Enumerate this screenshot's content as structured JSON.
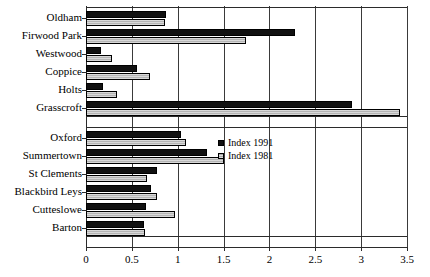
{
  "chart_data": {
    "type": "bar",
    "orientation": "horizontal",
    "title": "",
    "xlabel": "",
    "ylabel": "",
    "xlim": [
      0,
      3.5
    ],
    "xticks": [
      0,
      0.5,
      1,
      1.5,
      2,
      2.5,
      3,
      3.5
    ],
    "xtick_labels": [
      "0",
      "0.5",
      "1",
      "1.5",
      "2",
      "2.5",
      "3",
      "3.5"
    ],
    "grid": true,
    "grid_axis": "x",
    "legend_position": "center-right",
    "legend": [
      "Index 1991",
      "Index 1981"
    ],
    "series": [
      {
        "name": "Index 1991",
        "color": "#111111",
        "values": [
          0.87,
          2.28,
          0.16,
          0.56,
          0.18,
          2.9,
          1.04,
          1.32,
          0.77,
          0.71,
          0.65,
          0.63
        ]
      },
      {
        "name": "Index 1981",
        "color": "#c8c8c8",
        "values": [
          0.86,
          1.74,
          0.28,
          0.7,
          0.34,
          3.42,
          1.09,
          1.5,
          0.67,
          0.77,
          0.97,
          0.64
        ]
      }
    ],
    "categories": [
      "Oldham",
      "Firwood Park",
      "Westwood",
      "Coppice",
      "Holts",
      "Grasscroft",
      "Oxford",
      "Summertown",
      "St Clements",
      "Blackbird Leys",
      "Cutteslowe",
      "Barton"
    ],
    "groups": [
      {
        "name": "group-upper",
        "categories": [
          "Oldham",
          "Firwood Park",
          "Westwood",
          "Coppice",
          "Holts",
          "Grasscroft"
        ]
      },
      {
        "name": "group-lower",
        "categories": [
          "Oxford",
          "Summertown",
          "St Clements",
          "Blackbird Leys",
          "Cutteslowe",
          "Barton"
        ]
      }
    ]
  },
  "legend": {
    "items": [
      {
        "label": "Index 1991",
        "swatch": "filled-black-square"
      },
      {
        "label": "Index 1981",
        "swatch": "hatched-grey-square"
      }
    ]
  },
  "axis": {
    "x_tick_labels": [
      "0",
      "0.5",
      "1",
      "1.5",
      "2",
      "2.5",
      "3",
      "3.5"
    ]
  },
  "rows": [
    {
      "label": "Oldham",
      "v1991": 0.87,
      "v1981": 0.86
    },
    {
      "label": "Firwood Park",
      "v1991": 2.28,
      "v1981": 1.74
    },
    {
      "label": "Westwood",
      "v1991": 0.16,
      "v1981": 0.28
    },
    {
      "label": "Coppice",
      "v1991": 0.56,
      "v1981": 0.7
    },
    {
      "label": "Holts",
      "v1991": 0.18,
      "v1981": 0.34
    },
    {
      "label": "Grasscroft",
      "v1991": 2.9,
      "v1981": 3.42
    },
    {
      "label": "Oxford",
      "v1991": 1.04,
      "v1981": 1.09
    },
    {
      "label": "Summertown",
      "v1991": 1.32,
      "v1981": 1.5
    },
    {
      "label": "St Clements",
      "v1991": 0.77,
      "v1981": 0.67
    },
    {
      "label": "Blackbird Leys",
      "v1991": 0.71,
      "v1981": 0.77
    },
    {
      "label": "Cutteslowe",
      "v1991": 0.65,
      "v1981": 0.97
    },
    {
      "label": "Barton",
      "v1991": 0.63,
      "v1981": 0.64
    }
  ]
}
